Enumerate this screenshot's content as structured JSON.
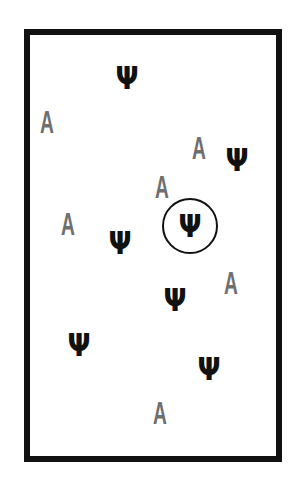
{
  "stimulus": {
    "frame_color": "#111111",
    "target_color": "#111111",
    "distractor_color": "#6f6f6f",
    "items": [
      {
        "glyph": "Ψ",
        "kind": "psi",
        "x": 127,
        "y": 78
      },
      {
        "glyph": "A",
        "kind": "a",
        "x": 47,
        "y": 122
      },
      {
        "glyph": "A",
        "kind": "a",
        "x": 199,
        "y": 148
      },
      {
        "glyph": "Ψ",
        "kind": "psi",
        "x": 237,
        "y": 160
      },
      {
        "glyph": "A",
        "kind": "a",
        "x": 162,
        "y": 187
      },
      {
        "glyph": "A",
        "kind": "a",
        "x": 68,
        "y": 224
      },
      {
        "glyph": "Ψ",
        "kind": "psi",
        "x": 190,
        "y": 226,
        "circled": true
      },
      {
        "glyph": "Ψ",
        "kind": "psi",
        "x": 120,
        "y": 243
      },
      {
        "glyph": "A",
        "kind": "a",
        "x": 231,
        "y": 283
      },
      {
        "glyph": "Ψ",
        "kind": "psi",
        "x": 175,
        "y": 300
      },
      {
        "glyph": "Ψ",
        "kind": "psi",
        "x": 79,
        "y": 345
      },
      {
        "glyph": "Ψ",
        "kind": "psi",
        "x": 209,
        "y": 369
      },
      {
        "glyph": "A",
        "kind": "a",
        "x": 160,
        "y": 413
      }
    ]
  }
}
